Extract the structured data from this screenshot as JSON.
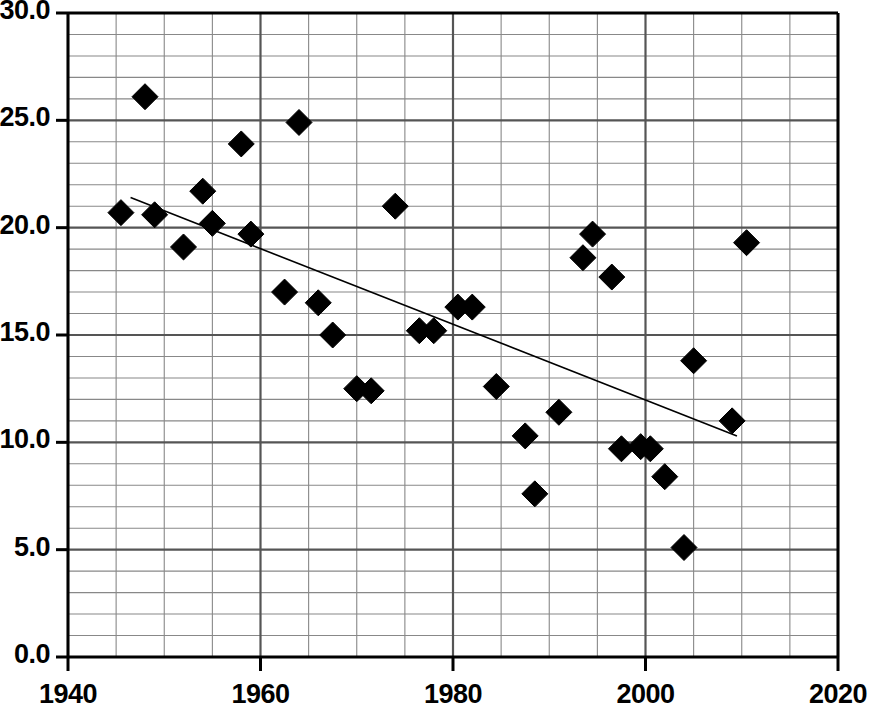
{
  "chart_data": {
    "type": "scatter",
    "title": "",
    "subtitle": "",
    "xlabel": "",
    "ylabel": "",
    "xlim": [
      1940,
      2020
    ],
    "ylim": [
      0.0,
      30.0
    ],
    "x_major_ticks": [
      1940,
      1960,
      1980,
      2000,
      2020
    ],
    "x_tick_labels": [
      "1940",
      "1960",
      "1980",
      "2000",
      "2020"
    ],
    "y_major_ticks": [
      0.0,
      5.0,
      10.0,
      15.0,
      20.0,
      25.0,
      30.0
    ],
    "y_tick_labels": [
      "0.0",
      "5.0",
      "10.0",
      "15.0",
      "20.0",
      "25.0",
      "30.0"
    ],
    "x_minor_step": 5,
    "y_minor_step": 1,
    "grid": true,
    "grid_minor": true,
    "legend": null,
    "marker": "diamond",
    "marker_color": "#000000",
    "marker_size": 26,
    "points": [
      {
        "x": 1945.5,
        "y": 20.7
      },
      {
        "x": 1948.0,
        "y": 26.1
      },
      {
        "x": 1949.0,
        "y": 20.6
      },
      {
        "x": 1952.0,
        "y": 19.1
      },
      {
        "x": 1954.0,
        "y": 21.7
      },
      {
        "x": 1955.0,
        "y": 20.2
      },
      {
        "x": 1958.0,
        "y": 23.9
      },
      {
        "x": 1959.0,
        "y": 19.7
      },
      {
        "x": 1962.5,
        "y": 17.0
      },
      {
        "x": 1964.0,
        "y": 24.9
      },
      {
        "x": 1966.0,
        "y": 16.5
      },
      {
        "x": 1967.5,
        "y": 15.0
      },
      {
        "x": 1970.0,
        "y": 12.5
      },
      {
        "x": 1971.5,
        "y": 12.4
      },
      {
        "x": 1974.0,
        "y": 21.0
      },
      {
        "x": 1976.5,
        "y": 15.2
      },
      {
        "x": 1978.0,
        "y": 15.2
      },
      {
        "x": 1980.5,
        "y": 16.3
      },
      {
        "x": 1982.0,
        "y": 16.3
      },
      {
        "x": 1984.5,
        "y": 12.6
      },
      {
        "x": 1987.5,
        "y": 10.3
      },
      {
        "x": 1988.5,
        "y": 7.6
      },
      {
        "x": 1991.0,
        "y": 11.4
      },
      {
        "x": 1993.5,
        "y": 18.6
      },
      {
        "x": 1994.5,
        "y": 19.7
      },
      {
        "x": 1996.5,
        "y": 17.7
      },
      {
        "x": 1997.5,
        "y": 9.7
      },
      {
        "x": 1999.5,
        "y": 9.8
      },
      {
        "x": 2000.5,
        "y": 9.7
      },
      {
        "x": 2002.0,
        "y": 8.4
      },
      {
        "x": 2004.0,
        "y": 5.1
      },
      {
        "x": 2005.0,
        "y": 13.8
      },
      {
        "x": 2009.0,
        "y": 11.0
      },
      {
        "x": 2010.5,
        "y": 19.3
      }
    ],
    "trendline": {
      "type": "line",
      "x_start": 1946.5,
      "y_start": 21.4,
      "x_end": 2009.5,
      "y_end": 10.3,
      "color": "#000000",
      "width": 1.6
    }
  },
  "colors": {
    "background": "#ffffff",
    "axis": "#000000",
    "grid_major": "#555555",
    "grid_minor": "#888888",
    "marker": "#000000",
    "trendline": "#000000",
    "tick_text": "#000000"
  }
}
